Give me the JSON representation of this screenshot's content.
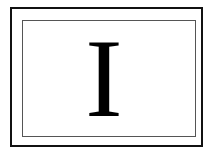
{
  "card": {
    "letter": "I",
    "colors": {
      "background": "#ffffff",
      "outer_border": "#111111",
      "inner_border": "#555555",
      "letter": "#000000"
    }
  }
}
